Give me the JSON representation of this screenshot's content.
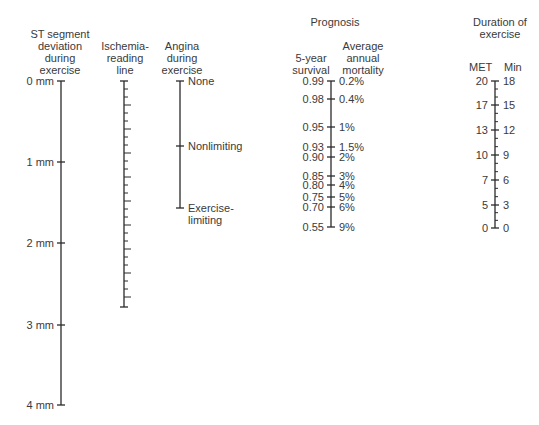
{
  "headers": {
    "st": "ST segment\ndeviation\nduring\nexercise",
    "ischemia": "Ischemia-\nreading\nline",
    "angina": "Angina\nduring\nexercise",
    "prognosis": "Prognosis",
    "survival": "5-year\nsurvival",
    "mortality": "Average\nannual\nmortality",
    "duration": "Duration of\nexercise",
    "met": "MET",
    "min": "Min"
  },
  "st_scale": [
    {
      "label": "0 mm",
      "y": 81
    },
    {
      "label": "1 mm",
      "y": 162
    },
    {
      "label": "2 mm",
      "y": 243
    },
    {
      "label": "3 mm",
      "y": 325
    },
    {
      "label": "4 mm",
      "y": 405
    }
  ],
  "angina_scale": [
    {
      "label": "None",
      "y": 81
    },
    {
      "label": "Nonlimiting",
      "y": 146
    },
    {
      "label": "Exercise-",
      "label2": "limiting",
      "y": 208
    }
  ],
  "prognosis_scale": [
    {
      "survival": "0.99",
      "mortality": "0.2%",
      "y": 81
    },
    {
      "survival": "0.98",
      "mortality": "0.4%",
      "y": 99
    },
    {
      "survival": "0.95",
      "mortality": "1%",
      "y": 127
    },
    {
      "survival": "0.93",
      "mortality": "1.5%",
      "y": 147
    },
    {
      "survival": "0.90",
      "mortality": "2%",
      "y": 157
    },
    {
      "survival": "0.85",
      "mortality": "3%",
      "y": 176
    },
    {
      "survival": "0.80",
      "mortality": "4%",
      "y": 185
    },
    {
      "survival": "0.75",
      "mortality": "5%",
      "y": 197
    },
    {
      "survival": "0.70",
      "mortality": "6%",
      "y": 207
    },
    {
      "survival": "0.55",
      "mortality": "9%",
      "y": 227
    }
  ],
  "duration_scale": [
    {
      "met": "20",
      "min": "18",
      "y": 81
    },
    {
      "met": "17",
      "min": "15",
      "y": 105
    },
    {
      "met": "13",
      "min": "12",
      "y": 130
    },
    {
      "met": "10",
      "min": "9",
      "y": 155
    },
    {
      "met": "7",
      "min": "6",
      "y": 180
    },
    {
      "met": "5",
      "min": "3",
      "y": 205
    },
    {
      "met": "0",
      "min": "0",
      "y": 228
    }
  ]
}
